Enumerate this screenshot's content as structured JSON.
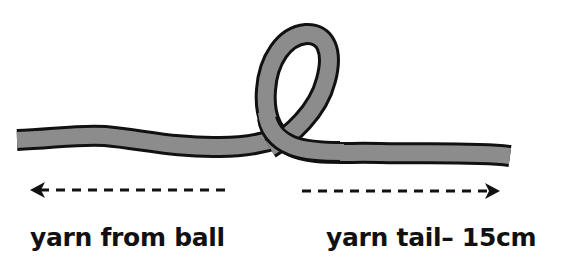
{
  "diagram": {
    "colors": {
      "yarn_fill": "#8c8c8c",
      "yarn_outline": "#111111",
      "arrow": "#111111",
      "text": "#111111",
      "background": "#ffffff"
    },
    "elements": {
      "yarn_strand": "yarn with single loop crossing over itself",
      "left_arrow": "dashed arrow pointing left",
      "right_arrow": "dashed arrow pointing right"
    },
    "labels": {
      "left": "yarn from ball",
      "right": "yarn tail– 15cm"
    }
  }
}
